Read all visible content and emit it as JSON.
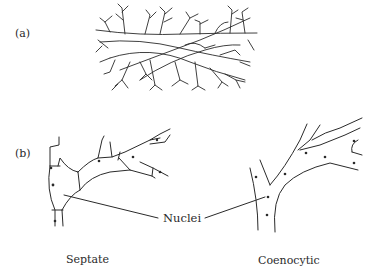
{
  "figure": {
    "panels": [
      {
        "id": "a",
        "label": "(a)",
        "description": "branching fungal mycelium"
      },
      {
        "id": "b",
        "label": "(b)",
        "description": "septate and coenocytic hyphae"
      }
    ],
    "annotations": {
      "nuclei": "Nuclei",
      "septate": "Septate",
      "coenocytic": "Coenocytic"
    }
  }
}
